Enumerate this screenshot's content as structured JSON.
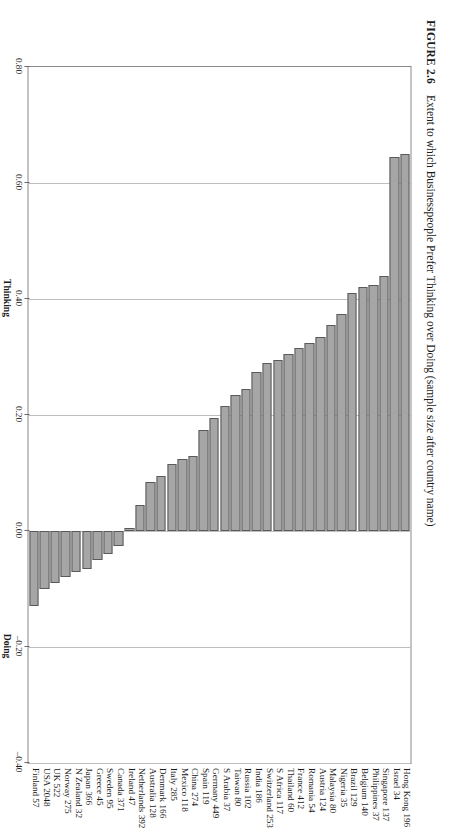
{
  "figure": {
    "number": "FIGURE 2.6",
    "caption": "Extent to which Businesspeople Prefer Thinking over Doing (sample size after country name)"
  },
  "axis": {
    "ticks": [
      "0.80",
      "0.60",
      "0.40",
      "0.20",
      "0.00",
      "–0.20",
      "–0.40"
    ],
    "tick_values": [
      0.8,
      0.6,
      0.4,
      0.2,
      0.0,
      -0.2,
      -0.4
    ],
    "positive_label": "Thinking",
    "negative_label": "Doing"
  },
  "style": {
    "bar_fill": "#a6a6a6",
    "bar_stroke": "#5a5a5a",
    "grid_color": "#bdbdbd",
    "frame_color": "#8a8a8a"
  },
  "chart_data": {
    "type": "bar",
    "orientation": "horizontal",
    "title": "Extent to which Businesspeople Prefer Thinking over Doing (sample size after country name)",
    "xlabel": "",
    "ylabel": "",
    "xlim": [
      0.8,
      -0.4
    ],
    "grid": true,
    "legend": null,
    "axis_positive_label": "Thinking",
    "axis_negative_label": "Doing",
    "categories": [
      "Hong Kong 196",
      "Israel 34",
      "Singapore 137",
      "Philippines 37",
      "Belgium 140",
      "Brazil 129",
      "Nigeria 35",
      "Malaysia 80",
      "Austria 124",
      "Romania 54",
      "France 412",
      "Thailand 60",
      "S Africa 117",
      "Switzerland 253",
      "India 186",
      "Russia 102",
      "Taiwan 80",
      "S Arabia 37",
      "Germany 449",
      "Spain 119",
      "China 274",
      "Mexico 118",
      "Italy 285",
      "Denmark 166",
      "Australia 128",
      "Netherlands 392",
      "Ireland 47",
      "Canada 371",
      "Sweden 95",
      "Greece 45",
      "Japan 366",
      "N Zealand 32",
      "Norway 275",
      "UK 522",
      "USA 2048",
      "Finland 57"
    ],
    "values": [
      0.65,
      0.645,
      0.44,
      0.425,
      0.42,
      0.41,
      0.375,
      0.355,
      0.335,
      0.325,
      0.315,
      0.305,
      0.295,
      0.29,
      0.275,
      0.245,
      0.235,
      0.215,
      0.195,
      0.175,
      0.13,
      0.125,
      0.115,
      0.095,
      0.085,
      0.045,
      0.005,
      -0.025,
      -0.04,
      -0.05,
      -0.065,
      -0.07,
      -0.08,
      -0.09,
      -0.1,
      -0.13
    ],
    "sample_sizes": [
      196,
      34,
      137,
      37,
      140,
      129,
      35,
      80,
      124,
      54,
      412,
      60,
      117,
      253,
      186,
      102,
      80,
      37,
      449,
      119,
      274,
      118,
      285,
      166,
      128,
      392,
      47,
      371,
      95,
      45,
      366,
      32,
      275,
      522,
      2048,
      57
    ]
  }
}
